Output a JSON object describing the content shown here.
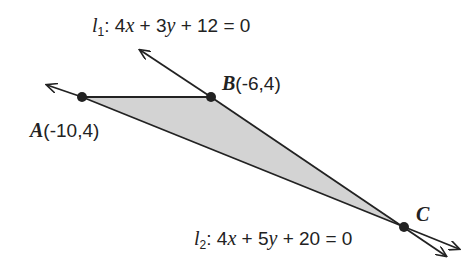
{
  "diagram": {
    "lines": [
      {
        "id": "l1",
        "name": "l",
        "subscript": "1",
        "equation": ": 4x + 3y + 12 = 0",
        "parts": [
          ": 4",
          "x",
          " + 3",
          "y",
          " + 12 = 0"
        ]
      },
      {
        "id": "l2",
        "name": "l",
        "subscript": "2",
        "equation": ": 4x + 5y + 20 = 0",
        "parts": [
          ": 4",
          "x",
          " + 5",
          "y",
          " + 20 = 0"
        ]
      }
    ],
    "points": [
      {
        "name": "A",
        "coords": "(-10,4)"
      },
      {
        "name": "B",
        "coords": "(-6,4)"
      },
      {
        "name": "C",
        "coords": ""
      }
    ],
    "colors": {
      "fill": "#d3d3d3",
      "stroke": "#222222"
    }
  }
}
